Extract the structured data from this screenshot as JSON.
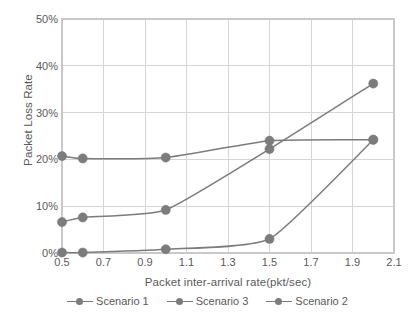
{
  "chart_data": {
    "type": "line",
    "title": "",
    "xlabel": "Packet inter-arrival rate(pkt/sec)",
    "ylabel": "Packet Loss Rate",
    "x": [
      0.5,
      0.6,
      1.0,
      1.5,
      2.0
    ],
    "xlim": [
      0.5,
      2.1
    ],
    "ylim": [
      0,
      50
    ],
    "xticks": [
      "0.5",
      "0.7",
      "0.9",
      "1.1",
      "1.3",
      "1.5",
      "1.7",
      "1.9",
      "2.1"
    ],
    "xtick_values": [
      0.5,
      0.7,
      0.9,
      1.1,
      1.3,
      1.5,
      1.7,
      1.9,
      2.1
    ],
    "yticks": [
      "0%",
      "10%",
      "20%",
      "30%",
      "40%",
      "50%"
    ],
    "ytick_values": [
      0,
      10,
      20,
      30,
      40,
      50
    ],
    "grid": true,
    "legend_position": "bottom",
    "y_unit": "%",
    "series": [
      {
        "name": "Scenario 1",
        "color": "#7c7c7c",
        "values": [
          20.7,
          20.2,
          20.4,
          24.0,
          24.2
        ]
      },
      {
        "name": "Scenario 3",
        "color": "#7c7c7c",
        "values": [
          6.6,
          7.6,
          9.2,
          22.2,
          36.2
        ]
      },
      {
        "name": "Scenario 2",
        "color": "#7c7c7c",
        "values": [
          0.1,
          0.1,
          0.8,
          3.0,
          24.2
        ]
      }
    ]
  },
  "style": {
    "grid_color": "#d6d6d6",
    "border_color": "#c9c9c9",
    "text_color": "#5a5a5a",
    "background": "#ffffff"
  }
}
